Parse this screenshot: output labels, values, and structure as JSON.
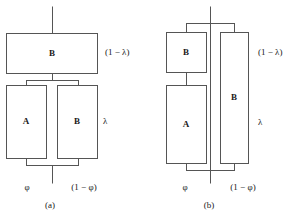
{
  "figure": {
    "title": "",
    "background_color": "#ffffff",
    "line_color": "#555555",
    "text_color": "#1a1a1a"
  },
  "panels": [
    {
      "id": "a",
      "caption": "(a)",
      "blocks": [
        {
          "id": "a-top-b",
          "label": "B"
        },
        {
          "id": "a-bottom-a",
          "label": "A"
        },
        {
          "id": "a-bottom-b",
          "label": "B"
        }
      ],
      "side_labels": [
        {
          "id": "a-one-minus-lambda",
          "text": "(1 − λ)"
        },
        {
          "id": "a-lambda",
          "text": "λ"
        }
      ],
      "bottom_labels": [
        {
          "id": "a-phi",
          "text": "φ"
        },
        {
          "id": "a-one-minus-phi",
          "text": "(1 − φ)"
        }
      ]
    },
    {
      "id": "b",
      "caption": "(b)",
      "blocks": [
        {
          "id": "b-top-b",
          "label": "B"
        },
        {
          "id": "b-bottom-a",
          "label": "A"
        },
        {
          "id": "b-tall-b",
          "label": "B"
        }
      ],
      "side_labels": [
        {
          "id": "b-one-minus-lambda",
          "text": "(1 − λ)"
        },
        {
          "id": "b-lambda",
          "text": "λ"
        }
      ],
      "bottom_labels": [
        {
          "id": "b-phi",
          "text": "φ"
        },
        {
          "id": "b-one-minus-phi",
          "text": "(1 − φ)"
        }
      ]
    }
  ]
}
